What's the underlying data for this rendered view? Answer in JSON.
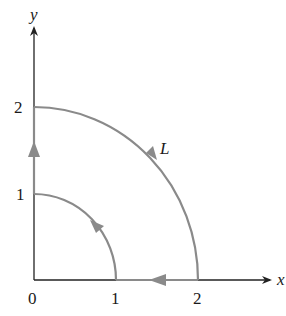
{
  "diagram": {
    "type": "line-integral-contour",
    "axes": {
      "x_label": "x",
      "y_label": "y",
      "origin_label": "0",
      "x_ticks": [
        "1",
        "2"
      ],
      "y_ticks": [
        "1",
        "2"
      ]
    },
    "curve_label": "L",
    "colors": {
      "axis": "#222222",
      "contour": "#8a8a8a",
      "text": "#1a1a1a"
    },
    "segments": [
      {
        "name": "outer-arc",
        "description": "quarter circle radius 2 from (0,2) to (2,0)",
        "direction": "clockwise"
      },
      {
        "name": "x-axis-segment",
        "description": "from (2,0) to (1,0)",
        "direction": "leftward"
      },
      {
        "name": "inner-arc",
        "description": "quarter circle radius 1 from (1,0) to (0,1)",
        "direction": "counterclockwise"
      },
      {
        "name": "y-axis-segment",
        "description": "from (0,1) to (0,2)",
        "direction": "upward"
      }
    ]
  }
}
